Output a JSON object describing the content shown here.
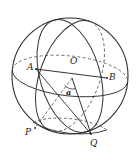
{
  "figure": {
    "type": "geometry-diagram",
    "width": 139,
    "height": 157,
    "background_color": "#ffffff",
    "stroke_color": "#2b2b2b",
    "dashed_stroke_color": "#555555"
  },
  "labels": {
    "point_a": "A",
    "point_o": "O",
    "point_b": "B",
    "point_p": "P",
    "point_q": "Q",
    "angle_a": "a"
  },
  "points": {
    "a": {
      "x": 36,
      "y": 69
    },
    "o": {
      "x": 72,
      "y": 78
    },
    "b": {
      "x": 107,
      "y": 78
    },
    "p": {
      "x": 35,
      "y": 128
    },
    "q": {
      "x": 91,
      "y": 134
    }
  },
  "sphere_outline": {
    "center_x": 70,
    "center_y": 76,
    "radius": 58
  },
  "label_positions": {
    "point_a": {
      "x": 27,
      "y": 63
    },
    "point_o": {
      "x": 70,
      "y": 58
    },
    "point_b": {
      "x": 109,
      "y": 73
    },
    "point_p": {
      "x": 26,
      "y": 129
    },
    "point_q": {
      "x": 90,
      "y": 140
    },
    "angle_a": {
      "x": 66,
      "y": 88
    }
  }
}
